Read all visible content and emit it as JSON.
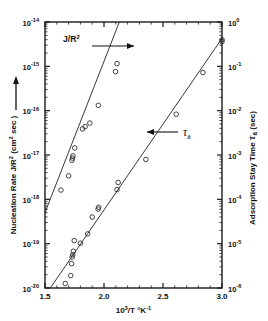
{
  "chart_data": {
    "type": "scatter",
    "title": "",
    "xlabel": "10³/T  °K⁻¹",
    "ylabel": "Nucleation Rate  J/R² (cm² sec)",
    "ylabel_right": "Adsorption Stay Time  τa (sec)",
    "xlim": [
      1.5,
      3.0
    ],
    "xticks": [
      "1.5",
      "2.0",
      "2.5",
      "3.0"
    ],
    "xtick_values": [
      1.5,
      2.0,
      2.5,
      3.0
    ],
    "ylim_left_log10": [
      -20,
      -14
    ],
    "yticks_left": [
      "10⁻¹⁴",
      "10⁻¹⁵",
      "10⁻¹⁶",
      "10⁻¹⁷",
      "10⁻¹⁸",
      "10⁻¹⁹",
      "10⁻²⁰"
    ],
    "ytick_left_exponents": [
      -14,
      -15,
      -16,
      -17,
      -18,
      -19,
      -20
    ],
    "ylim_right_log10": [
      -6,
      0
    ],
    "yticks_right": [
      "10⁰",
      "10⁻¹",
      "10⁻²",
      "10⁻³",
      "10⁻⁴",
      "10⁻⁵",
      "10⁻⁶"
    ],
    "ytick_right_exponents": [
      0,
      -1,
      -2,
      -3,
      -4,
      -5,
      -6
    ],
    "grid": false,
    "legend": "inline-annotations",
    "marker": "open-circle",
    "line_color": "#222222",
    "marker_color": "#222222",
    "series": [
      {
        "name": "J/R²",
        "axis": "left",
        "annotation": "J/R²",
        "arrow": "right",
        "fit_line": {
          "x0": 1.5,
          "y0": -18.3,
          "x1": 2.13,
          "y1": -14.0
        },
        "points": [
          {
            "x": 1.635,
            "y": -17.79
          },
          {
            "x": 1.7,
            "y": -17.47
          },
          {
            "x": 1.728,
            "y": -17.12
          },
          {
            "x": 1.733,
            "y": -17.07
          },
          {
            "x": 1.737,
            "y": -17.02
          },
          {
            "x": 1.752,
            "y": -16.84
          },
          {
            "x": 1.818,
            "y": -16.41
          },
          {
            "x": 1.84,
            "y": -16.36
          },
          {
            "x": 1.88,
            "y": -16.28
          },
          {
            "x": 1.952,
            "y": -15.88
          },
          {
            "x": 2.098,
            "y": -15.12
          },
          {
            "x": 2.11,
            "y": -14.94
          }
        ]
      },
      {
        "name": "τa",
        "axis": "right",
        "annotation": "τa",
        "arrow": "left",
        "fit_line": {
          "x0": 1.545,
          "y0": -6.0,
          "x1": 3.0,
          "y1": -0.37
        },
        "points": [
          {
            "x": 1.672,
            "y": -5.9
          },
          {
            "x": 1.718,
            "y": -5.72
          },
          {
            "x": 1.725,
            "y": -5.45
          },
          {
            "x": 1.73,
            "y": -5.3
          },
          {
            "x": 1.735,
            "y": -5.25
          },
          {
            "x": 1.74,
            "y": -5.17
          },
          {
            "x": 1.748,
            "y": -4.93
          },
          {
            "x": 1.8,
            "y": -4.99
          },
          {
            "x": 1.862,
            "y": -4.78
          },
          {
            "x": 1.9,
            "y": -4.4
          },
          {
            "x": 1.95,
            "y": -4.22
          },
          {
            "x": 1.955,
            "y": -4.18
          },
          {
            "x": 2.11,
            "y": -3.78
          },
          {
            "x": 2.12,
            "y": -3.62
          },
          {
            "x": 2.355,
            "y": -3.1
          },
          {
            "x": 2.612,
            "y": -2.08
          },
          {
            "x": 2.838,
            "y": -1.14
          },
          {
            "x": 3.0,
            "y": -0.4
          },
          {
            "x": 3.0,
            "y": -0.44
          }
        ]
      }
    ]
  },
  "axes": {
    "left_label": "Nucleation Rate  J/R² (cm² sec)",
    "right_label": "Adsorption Stay Time  τa (sec)",
    "bottom_label": "10³/T  °K⁻¹",
    "left_arrow_icon": "up-arrow-icon"
  }
}
